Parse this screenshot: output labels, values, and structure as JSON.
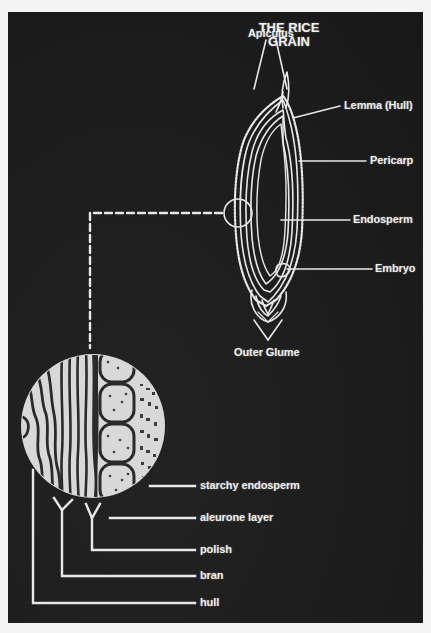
{
  "title": {
    "line1": "THE RICE",
    "line2": "GRAIN"
  },
  "grain_labels": {
    "apiculus": "Apiculus",
    "lemma": "Lemma (Hull)",
    "pericarp": "Pericarp",
    "endosperm": "Endosperm",
    "embryo": "Embryo",
    "outer_glume": "Outer Glume"
  },
  "detail_labels": {
    "starchy_endosperm": "starchy endosperm",
    "aleurone_layer": "aleurone layer",
    "polish": "polish",
    "bran": "bran",
    "hull": "hull"
  },
  "colors": {
    "background": "#1d1d1d",
    "line": "#eaeaea",
    "page": "#f4f4f4"
  }
}
